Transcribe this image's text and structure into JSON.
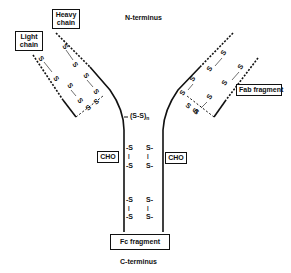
{
  "diagram": {
    "labels": {
      "n_terminus": "N-terminus",
      "c_terminus": "C-terminus",
      "heavy_chain": "Heavy chain",
      "light_chain": "Light chain",
      "fab_fragment": "Fab fragment",
      "fc_fragment": "Fc fragment",
      "cho_left": "CHO",
      "cho_right": "CHO",
      "hinge": "(S-S)",
      "hinge_subscript": "n"
    },
    "disulfide_symbol": "S",
    "colors": {
      "line": "#111111",
      "background": "#ffffff"
    }
  }
}
